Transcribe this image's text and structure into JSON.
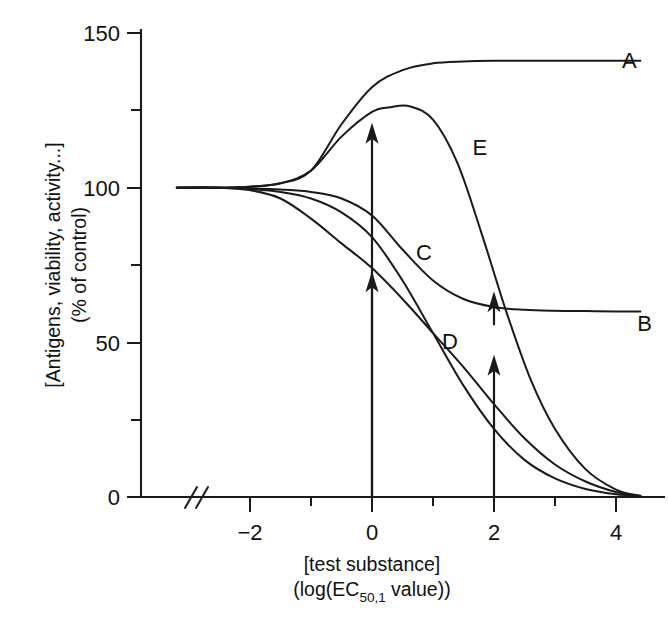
{
  "figure": {
    "background_color": "#ffffff",
    "ink_color": "#1a1a1a"
  },
  "chart_data": {
    "type": "line",
    "title": "",
    "subtitle": "",
    "xlabel_line1": "[test substance]",
    "xlabel_line2_pre": "(log(EC",
    "xlabel_line2_sub": "50,1",
    "xlabel_line2_post": " value))",
    "ylabel_line1": "[Antigens, viability, activity...]",
    "ylabel_line2": "(% of control)",
    "xlim": [
      -3.4,
      4.6
    ],
    "ylim": [
      0,
      152
    ],
    "x_major_ticks": [
      -2,
      0,
      2,
      4
    ],
    "x_major_tick_labels": [
      "−2",
      "0",
      "2",
      "4"
    ],
    "x_minor_ticks": [
      -1,
      1,
      3
    ],
    "y_major_ticks": [
      0,
      50,
      100,
      150
    ],
    "y_major_tick_labels": [
      "0",
      "50",
      "100",
      "150"
    ],
    "y_minor_ticks": [
      25,
      75,
      125
    ],
    "grid": false,
    "legend": "inline-curve-labels",
    "axis_break": {
      "axis": "x",
      "symbol": "//",
      "x_position": -3.0,
      "note": "double slash break on x axis near origin"
    },
    "control_level": 100,
    "series": [
      {
        "name": "A",
        "label": "A",
        "label_x": 4.1,
        "label_y": 141,
        "description": "monotonic increase from control to elevated plateau",
        "plateau_low": 100,
        "plateau_high": 141,
        "ec50": -0.45,
        "hill": 1.6,
        "points_x": [
          -3.2,
          -2.5,
          -2.0,
          -1.5,
          -1.0,
          -0.5,
          0.0,
          0.5,
          1.0,
          1.5,
          2.0,
          2.5,
          3.0,
          3.5,
          4.0,
          4.4
        ],
        "points_y": [
          100,
          100,
          100.3,
          101.4,
          105.5,
          120.5,
          132.5,
          138.0,
          140.2,
          140.8,
          141.0,
          141.0,
          141.0,
          141.0,
          141.0,
          141.0
        ]
      },
      {
        "name": "B",
        "label": "B",
        "label_x": 4.35,
        "label_y": 56,
        "description": "monotonic decrease from control to depressed plateau",
        "plateau_high": 100,
        "plateau_low": 60,
        "ec50": 0.55,
        "hill": 1.5,
        "points_x": [
          -3.2,
          -2.5,
          -2.0,
          -1.5,
          -1.0,
          -0.5,
          0.0,
          0.5,
          1.0,
          1.5,
          2.0,
          2.5,
          3.0,
          3.5,
          4.0,
          4.4
        ],
        "points_y": [
          100,
          100,
          99.8,
          99.4,
          98.6,
          96.5,
          91.0,
          80.0,
          70.0,
          64.0,
          61.4,
          60.5,
          60.2,
          60.1,
          60.0,
          60.0
        ]
      },
      {
        "name": "C",
        "label": "C",
        "label_x": 0.72,
        "label_y": 79,
        "description": "sigmoidal decrease from control to zero",
        "plateau_high": 100,
        "plateau_low": 0,
        "ec50": 1.55,
        "hill": 1.55,
        "points_x": [
          -3.2,
          -2.5,
          -2.0,
          -1.5,
          -1.0,
          -0.5,
          0.0,
          0.5,
          1.0,
          1.5,
          2.0,
          2.5,
          3.0,
          3.5,
          4.0,
          4.4
        ],
        "points_y": [
          100,
          100,
          99.6,
          98.6,
          96.5,
          92.0,
          84.0,
          70.0,
          53.0,
          36.0,
          22.0,
          12.0,
          6.0,
          2.6,
          0.9,
          0.3
        ]
      },
      {
        "name": "D",
        "label": "D",
        "label_x": 1.15,
        "label_y": 50,
        "description": "early sigmoidal decrease from control to zero, shifted left of C",
        "plateau_high": 100,
        "plateau_low": 0,
        "ec50": 0.55,
        "hill": 1.0,
        "points_x": [
          -3.2,
          -2.5,
          -2.0,
          -1.5,
          -1.0,
          -0.5,
          0.0,
          0.5,
          1.0,
          1.5,
          2.0,
          2.5,
          3.0,
          3.5,
          4.0,
          4.4
        ],
        "points_y": [
          100,
          100,
          99.2,
          96.5,
          90.0,
          82.0,
          74.0,
          64.0,
          53.0,
          42.0,
          30.0,
          19.0,
          10.5,
          5.0,
          1.6,
          0.3
        ]
      },
      {
        "name": "E",
        "label": "E",
        "label_x": 1.65,
        "label_y": 113,
        "description": "biphasic: stimulation peak then decrease to zero",
        "peak_value": 126,
        "peak_x": 0.62,
        "plateau_low": 0,
        "points_x": [
          -3.2,
          -2.5,
          -2.0,
          -1.5,
          -1.0,
          -0.5,
          0.0,
          0.3,
          0.62,
          1.0,
          1.4,
          1.8,
          2.2,
          2.6,
          3.0,
          3.5,
          4.0,
          4.4
        ],
        "points_y": [
          100,
          100,
          100.3,
          101.4,
          105.5,
          116.5,
          124.5,
          126.0,
          126.3,
          122.0,
          108.0,
          85.0,
          60.0,
          38.0,
          22.0,
          9.0,
          2.4,
          0.4
        ]
      }
    ],
    "annotations": [
      {
        "name": "arrow-x0-upper",
        "type": "arrow",
        "x": 0.0,
        "y_start": 0,
        "y_end": 121,
        "direction": "up",
        "note": "points from baseline to the A/E stimulation curve at log dose 0"
      },
      {
        "name": "arrow-x0-lower",
        "type": "arrow",
        "x": 0.0,
        "y_start": 0,
        "y_end": 73,
        "direction": "up",
        "note": "points from baseline to the D inhibition curve at log dose 0"
      },
      {
        "name": "arrow-x2-upper",
        "type": "arrow",
        "x": 2.0,
        "y_start": 55.5,
        "y_end": 66.5,
        "direction": "up",
        "note": "short arrow up to the B plateau at log dose 2"
      },
      {
        "name": "arrow-x2-lower",
        "type": "arrow",
        "x": 2.0,
        "y_start": 0,
        "y_end": 46,
        "direction": "up",
        "note": "points from baseline up to the C curve at log dose 2"
      }
    ]
  }
}
